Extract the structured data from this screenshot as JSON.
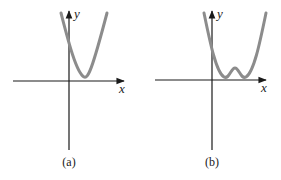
{
  "figure": {
    "panels": [
      {
        "id": "a",
        "caption": "(a)",
        "x_axis_label": "x",
        "y_axis_label": "y",
        "curve_description": "parabola-like curve with a single minimum just above the x-axis, to the right of the y-axis"
      },
      {
        "id": "b",
        "caption": "(b)",
        "x_axis_label": "x",
        "y_axis_label": "y",
        "curve_description": "W-shaped curve with two minima just above the x-axis and a small local maximum between them, to the right of the y-axis"
      }
    ],
    "colors": {
      "axis": "#1a1a1a",
      "curve": "#8c8c8c"
    }
  }
}
